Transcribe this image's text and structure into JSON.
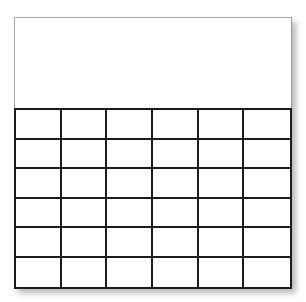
{
  "template": {
    "header": {
      "title": ""
    },
    "grid": {
      "rows": 6,
      "columns": 6,
      "cells": [
        [
          "",
          "",
          "",
          "",
          "",
          ""
        ],
        [
          "",
          "",
          "",
          "",
          "",
          ""
        ],
        [
          "",
          "",
          "",
          "",
          "",
          ""
        ],
        [
          "",
          "",
          "",
          "",
          "",
          ""
        ],
        [
          "",
          "",
          "",
          "",
          "",
          ""
        ],
        [
          "",
          "",
          "",
          "",
          "",
          ""
        ]
      ]
    },
    "colors": {
      "background": "#ffffff",
      "grid_line": "#1c1c1c",
      "card_border": "#a8a8a8"
    }
  }
}
